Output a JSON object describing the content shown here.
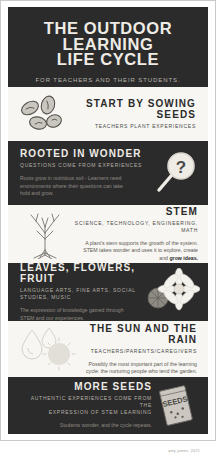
{
  "header": {
    "title_line1": "THE OUTDOOR",
    "title_line2": "LEARNING",
    "title_line3": "LIFE CYCLE",
    "subtitle": "FOR TEACHERS AND THEIR STUDENTS."
  },
  "sections": [
    {
      "id": "sowing-seeds",
      "title": "START BY SOWING SEEDS",
      "subtitle": "TEACHERS PLANT EXPERIENCES",
      "body": "",
      "icon": "seeds-icon",
      "theme": "light",
      "align": "right"
    },
    {
      "id": "rooted-in-wonder",
      "title": "ROOTED IN WONDER",
      "subtitle": "QUESTIONS COME FROM EXPERIENCES",
      "body": "Roots grow in nutritious soil - Learners need environments where their questions can take hold and grow.",
      "icon": "magnifying-glass-question-icon",
      "theme": "dark",
      "align": "left"
    },
    {
      "id": "stem",
      "title": "STEM",
      "subtitle": "SCIENCE, TECHNOLOGY, ENGINEERING, MATH",
      "body": "A plant's stem supports the growth of the system. STEM takes wonder and uses it to explore, create and ",
      "body_bold": "grow ideas.",
      "icon": "plant-roots-icon",
      "theme": "light",
      "align": "right"
    },
    {
      "id": "leaves-flowers-fruit",
      "title": "LEAVES, FLOWERS, FRUIT",
      "subtitle": "LANGUAGE ARTS, FINE ARTS, SOCIAL STUDIES, MUSIC",
      "body": "The expression of knowledge gained through STEM and our experiences.",
      "icon": "flower-icon",
      "theme": "dark",
      "align": "left"
    },
    {
      "id": "sun-and-rain",
      "title": "THE SUN AND THE RAIN",
      "subtitle": "TEACHERS/PARENTS/CAREGIVERS",
      "body": "Possibly the most important part of the learning cycle: the nurturing people who tend the garden.",
      "icon": "sun-raindrops-icon",
      "theme": "light",
      "align": "right"
    },
    {
      "id": "more-seeds",
      "title": "MORE SEEDS",
      "subtitle_line1": "AUTHENTIC EXPERIENCES COME FROM THE",
      "subtitle_line2": "EXPRESSION OF STEM LEARNING",
      "body": "Students wonder, and the cycle repeats.",
      "icon": "seed-packet-icon",
      "packet_label": "SEEDS",
      "theme": "dark",
      "align": "right"
    }
  ],
  "footer": {
    "credit": "amy james, 2021"
  },
  "colors": {
    "dark_band": "#2b2b2b",
    "light_band": "#f7f6f2",
    "page": "#ffffff",
    "title_text": "#efece6",
    "muted_text": "#8f8a82"
  }
}
